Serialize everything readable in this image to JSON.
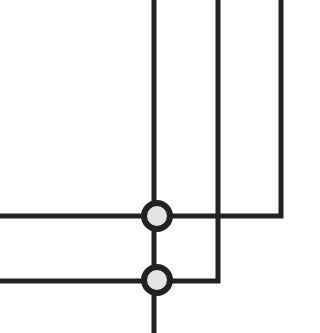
{
  "diagram": {
    "type": "wiring-diagram",
    "colors": {
      "background": "#ffffff",
      "wire": "#222222",
      "node_fill": "#e4e4e4",
      "node_stroke": "#222222"
    },
    "wire_width": 5,
    "wires": [
      {
        "id": "wire-vertical-left",
        "points": [
          [
            154,
            0
          ],
          [
            154,
            333
          ]
        ]
      },
      {
        "id": "wire-top-horizontal-to-right-vertical",
        "points": [
          [
            0,
            216
          ],
          [
            281,
            216
          ],
          [
            281,
            0
          ]
        ]
      },
      {
        "id": "wire-bottom-horizontal-to-middle-vertical",
        "points": [
          [
            0,
            281
          ],
          [
            218,
            281
          ],
          [
            218,
            0
          ]
        ]
      }
    ],
    "nodes": [
      {
        "id": "junction-top",
        "cx": 157,
        "cy": 216,
        "r": 13
      },
      {
        "id": "junction-bottom",
        "cx": 157,
        "cy": 280,
        "r": 13
      }
    ]
  }
}
